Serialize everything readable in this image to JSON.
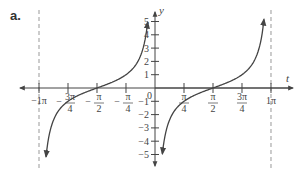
{
  "figure_label": "a.",
  "chart_data": {
    "type": "line",
    "title": "",
    "function": "y = -cot(t)",
    "xlabel": "t",
    "ylabel": "y",
    "xlim": [
      -3.14159,
      3.14159
    ],
    "ylim": [
      -5,
      5
    ],
    "grid": false,
    "x_ticks": [
      {
        "value": -3.14159,
        "label": "−1π"
      },
      {
        "value": -2.35619,
        "label": "3π/4",
        "num": "3π",
        "den": "4",
        "sign": "−"
      },
      {
        "value": -1.5708,
        "label": "π/2",
        "num": "π",
        "den": "2",
        "sign": "−"
      },
      {
        "value": -0.7854,
        "label": "π/4",
        "num": "π",
        "den": "4",
        "sign": "−"
      },
      {
        "value": 0.7854,
        "label": "π/4",
        "num": "π",
        "den": "4",
        "sign": ""
      },
      {
        "value": 1.5708,
        "label": "π/2",
        "num": "π",
        "den": "2",
        "sign": ""
      },
      {
        "value": 2.35619,
        "label": "3π/4",
        "num": "3π",
        "den": "4",
        "sign": ""
      },
      {
        "value": 3.14159,
        "label": "1π"
      }
    ],
    "y_ticks": [
      5,
      4,
      3,
      2,
      1,
      -1,
      -2,
      -3,
      -4,
      -5
    ],
    "origin_label": "0",
    "asymptotes": [
      -3.14159,
      3.14159
    ],
    "series": [
      {
        "name": "branch-left",
        "t_range": [
          -2.95,
          -0.2
        ],
        "points": [
          [
            -2.95,
            -5
          ],
          [
            -2.356,
            -1
          ],
          [
            -1.571,
            0
          ],
          [
            -0.785,
            1
          ],
          [
            -0.2,
            5
          ]
        ]
      },
      {
        "name": "branch-right",
        "t_range": [
          0.2,
          2.95
        ],
        "points": [
          [
            0.2,
            -5
          ],
          [
            0.785,
            -1
          ],
          [
            1.571,
            0
          ],
          [
            2.356,
            1
          ],
          [
            2.95,
            5
          ]
        ]
      }
    ],
    "curve_color": "#444444",
    "axis_color": "#444444",
    "asymptote_color": "#999999"
  }
}
